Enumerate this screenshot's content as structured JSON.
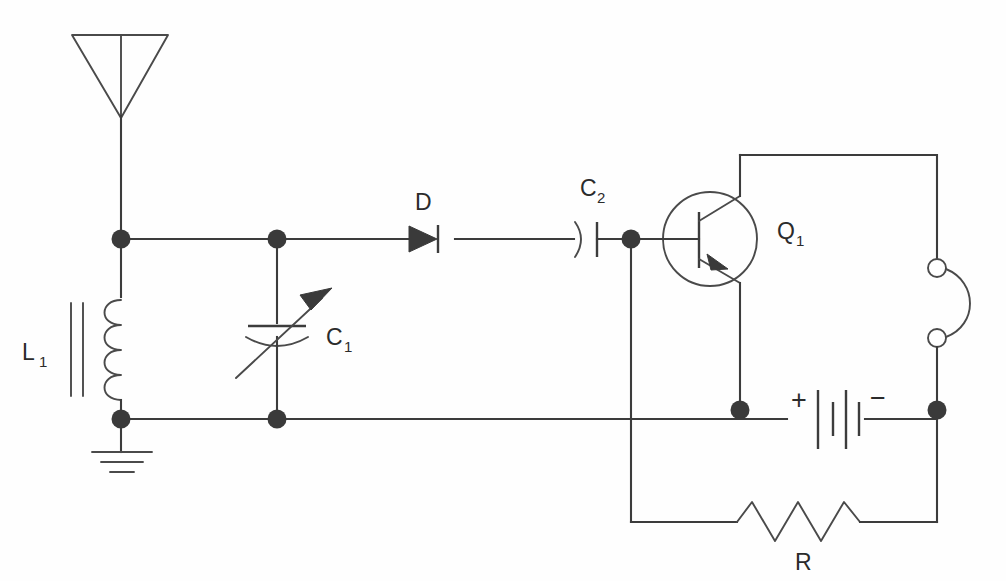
{
  "diagram": {
    "type": "electronic-schematic",
    "background_color": "#fefefe",
    "line_color": "#3c3c3c",
    "text_color": "#2b2b2b"
  },
  "components": {
    "antenna": {
      "name": "antenna",
      "symbol": "inverted-triangle-dipole",
      "label": ""
    },
    "inductor": {
      "name": "inductor",
      "label": "L",
      "subscript": "1",
      "symbol": "coil-with-ferrite-core",
      "turns": 4,
      "core": "two vertical bars"
    },
    "ground": {
      "name": "ground",
      "symbol": "earth-ground",
      "bars": 3,
      "label": ""
    },
    "variable_capacitor": {
      "name": "variable-capacitor",
      "label": "C",
      "subscript": "1",
      "symbol": "variable-capacitor-with-arrow"
    },
    "diode": {
      "name": "diode",
      "label": "D",
      "subscript": "",
      "symbol": "diode-anode-left-cathode-right"
    },
    "coupling_capacitor": {
      "name": "coupling-capacitor",
      "label": "C",
      "subscript": "2",
      "symbol": "polarized-capacitor-curved-left-plate"
    },
    "transistor": {
      "name": "transistor",
      "label": "Q",
      "subscript": "1",
      "symbol": "pnp-bipolar-transistor",
      "terminals": [
        "base-left",
        "collector-top",
        "emitter-bottom"
      ]
    },
    "earphone": {
      "name": "earphone",
      "symbol": "headphone-two-terminals-curve",
      "label": ""
    },
    "battery": {
      "name": "battery",
      "symbol": "two-cell-battery",
      "positive_label": "+",
      "negative_label": "−",
      "cells": 2
    },
    "resistor": {
      "name": "resistor",
      "label": "R",
      "subscript": "",
      "symbol": "zigzag-resistor",
      "peaks": 3
    }
  },
  "junctions": {
    "count": 7,
    "filled": 7,
    "open": 2
  }
}
